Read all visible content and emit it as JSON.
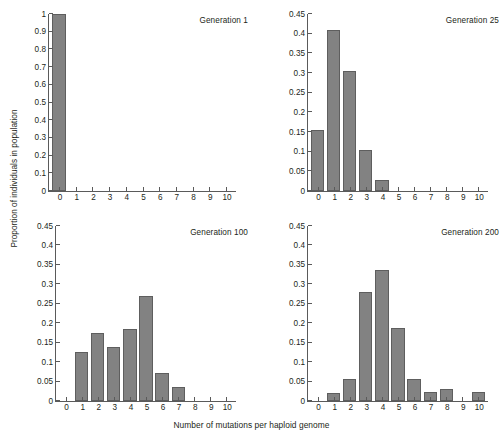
{
  "figure": {
    "xlabel": "Number of mutations per haploid genome",
    "ylabel": "Proportion of individuals in population",
    "bar_color": "#828282",
    "bar_edge_color": "#5e5e5e",
    "axis_color": "#5a5a5a",
    "background": "#ffffff"
  },
  "chart_data": [
    {
      "type": "bar",
      "title": "Generation 1",
      "xlabel": "Number of mutations per haploid genome",
      "ylabel": "Proportion of individuals in population",
      "categories": [
        0,
        1,
        2,
        3,
        4,
        5,
        6,
        7,
        8,
        9,
        10
      ],
      "values": [
        1.0,
        0,
        0,
        0,
        0,
        0,
        0,
        0,
        0,
        0,
        0
      ],
      "xlim": [
        -0.6,
        10.6
      ],
      "ylim": [
        0,
        1
      ],
      "ytick_values": [
        0,
        0.1,
        0.2,
        0.3,
        0.4,
        0.5,
        0.6,
        0.7,
        0.8,
        0.9,
        1
      ],
      "ytick_labels": [
        "0",
        "0.1",
        "0.2",
        "0.3",
        "0.4",
        "0.5",
        "0.6",
        "0.7",
        "0.8",
        "0.9",
        "1"
      ],
      "xtick_labels": [
        "0",
        "1",
        "2",
        "3",
        "4",
        "5",
        "6",
        "7",
        "8",
        "9",
        "10"
      ],
      "grid": false,
      "legend": "none"
    },
    {
      "type": "bar",
      "title": "Generation 25",
      "xlabel": "Number of mutations per haploid genome",
      "ylabel": "Proportion of individuals in population",
      "categories": [
        0,
        1,
        2,
        3,
        4,
        5,
        6,
        7,
        8,
        9,
        10
      ],
      "values": [
        0.155,
        0.41,
        0.305,
        0.105,
        0.027,
        0,
        0,
        0,
        0,
        0,
        0
      ],
      "xlim": [
        -0.6,
        10.6
      ],
      "ylim": [
        0,
        0.45
      ],
      "ytick_values": [
        0,
        0.05,
        0.1,
        0.15,
        0.2,
        0.25,
        0.3,
        0.35,
        0.4,
        0.45
      ],
      "ytick_labels": [
        "0",
        "0.05",
        "0.1",
        "0.15",
        "0.2",
        "0.25",
        "0.3",
        "0.35",
        "0.4",
        "0.45"
      ],
      "xtick_labels": [
        "0",
        "1",
        "2",
        "3",
        "4",
        "5",
        "6",
        "7",
        "8",
        "9",
        "10"
      ],
      "grid": false,
      "legend": "none"
    },
    {
      "type": "bar",
      "title": "Generation 100",
      "xlabel": "Number of mutations per haploid genome",
      "ylabel": "Proportion of individuals in population",
      "categories": [
        0,
        1,
        2,
        3,
        4,
        5,
        6,
        7,
        8,
        9,
        10
      ],
      "values": [
        0,
        0.125,
        0.176,
        0.14,
        0.186,
        0.27,
        0.072,
        0.037,
        0,
        0,
        0
      ],
      "xlim": [
        -0.6,
        10.6
      ],
      "ylim": [
        0,
        0.45
      ],
      "ytick_values": [
        0,
        0.05,
        0.1,
        0.15,
        0.2,
        0.25,
        0.3,
        0.35,
        0.4,
        0.45
      ],
      "ytick_labels": [
        "0",
        "0.05",
        "0.1",
        "0.15",
        "0.2",
        "0.25",
        "0.3",
        "0.35",
        "0.4",
        "0.45"
      ],
      "xtick_labels": [
        "0",
        "1",
        "2",
        "3",
        "4",
        "5",
        "6",
        "7",
        "8",
        "9",
        "10"
      ],
      "grid": false,
      "legend": "none"
    },
    {
      "type": "bar",
      "title": "Generation 200",
      "xlabel": "Number of mutations per haploid genome",
      "ylabel": "Proportion of individuals in population",
      "categories": [
        0,
        1,
        2,
        3,
        4,
        5,
        6,
        7,
        8,
        9,
        10
      ],
      "values": [
        0,
        0.021,
        0.056,
        0.281,
        0.337,
        0.187,
        0.057,
        0.022,
        0.032,
        0,
        0.022
      ],
      "xlim": [
        -0.6,
        10.6
      ],
      "ylim": [
        0,
        0.45
      ],
      "ytick_values": [
        0,
        0.05,
        0.1,
        0.15,
        0.2,
        0.25,
        0.3,
        0.35,
        0.4,
        0.45
      ],
      "ytick_labels": [
        "0",
        "0.05",
        "0.1",
        "0.15",
        "0.2",
        "0.25",
        "0.3",
        "0.35",
        "0.4",
        "0.45"
      ],
      "xtick_labels": [
        "0",
        "1",
        "2",
        "3",
        "4",
        "5",
        "6",
        "7",
        "8",
        "9",
        "10"
      ],
      "grid": false,
      "legend": "none"
    }
  ]
}
